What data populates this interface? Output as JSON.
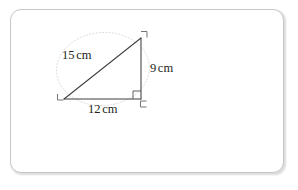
{
  "document": {
    "title": "Right triangle with labelled sides",
    "background_color": "#ffffff"
  },
  "card": {
    "name": "slide-card",
    "border_color": "#c8c8c8",
    "fill_color": "#ffffff"
  },
  "figure": {
    "type": "right-triangle-diagram",
    "stroke_color": "#3a3a3a",
    "guide_color": "#d9d9d9",
    "vertices": {
      "top": {
        "x": 141,
        "y": 38
      },
      "bottom_left": {
        "x": 64,
        "y": 99
      },
      "bottom_right": {
        "x": 141,
        "y": 99
      }
    },
    "right_angle_marker": {
      "name": "right-angle-square",
      "at": "bottom_right"
    },
    "corner_ticks": [
      {
        "name": "corner-tick-top",
        "x": 144,
        "y": 31
      },
      {
        "name": "corner-tick-bottom-left",
        "x": 55,
        "y": 96
      },
      {
        "name": "corner-tick-bottom-right",
        "x": 143,
        "y": 104
      }
    ],
    "guide_ellipse": {
      "name": "dotted-guide-ellipse",
      "cx": 103,
      "cy": 69,
      "rx": 46,
      "ry": 36,
      "dashed": true
    }
  },
  "labels": {
    "hypotenuse": {
      "value": "15",
      "unit": "cm"
    },
    "vertical": {
      "value": "9",
      "unit": "cm"
    },
    "base": {
      "value": "12",
      "unit": "cm"
    }
  }
}
